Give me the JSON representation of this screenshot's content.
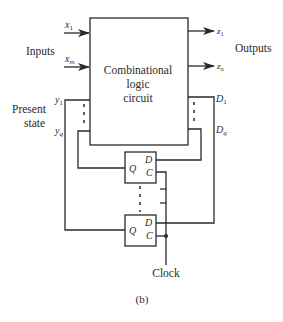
{
  "diagram": {
    "caption": "(b)",
    "main_block": {
      "line1": "Combinational",
      "line2": "logic",
      "line3": "circuit"
    },
    "inputs": {
      "group_label": "Inputs",
      "first": {
        "var": "x",
        "sub": "1"
      },
      "last": {
        "var": "x",
        "sub": "m"
      }
    },
    "outputs": {
      "group_label": "Outputs",
      "first": {
        "var": "z",
        "sub": "1"
      },
      "last": {
        "var": "z",
        "sub": "n"
      }
    },
    "present_state": {
      "label_line1": "Present",
      "label_line2": "state",
      "first": {
        "var": "y",
        "sub": "1"
      },
      "last": {
        "var": "y",
        "sub": "q"
      }
    },
    "next_state": {
      "first": {
        "var": "D",
        "sub": "1"
      },
      "last": {
        "var": "D",
        "sub": "q"
      }
    },
    "flip_flops": [
      {
        "q": "Q",
        "d": "D",
        "c": "C"
      },
      {
        "q": "Q",
        "d": "D",
        "c": "C"
      }
    ],
    "clock_label": "Clock"
  }
}
